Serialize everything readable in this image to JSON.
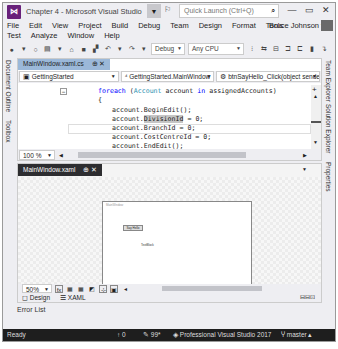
{
  "window": {
    "title": "Chapter 4 - Microsoft Visual Studio",
    "quick_launch_placeholder": "Quick Launch (Ctrl+Q)",
    "user": "Bruce Johnson",
    "user_arrow": "▾"
  },
  "menu": {
    "row1": [
      "File",
      "Edit",
      "View",
      "Project",
      "Build",
      "Debug",
      "Team",
      "Design",
      "Format",
      "Tools"
    ],
    "row2": [
      "Test",
      "Analyze",
      "Window",
      "Help"
    ]
  },
  "toolbar": {
    "config": "Debug",
    "platform": "Any CPU"
  },
  "left_tabs": [
    "Document Outline",
    "Toolbox"
  ],
  "right_tabs": [
    "Team Explorer",
    "Solution Explorer",
    "Properties"
  ],
  "editor": {
    "tab_label": "MainWindow.xaml.cs",
    "tab_pin": "⊕",
    "tab_close": "✕",
    "nav": {
      "project": "GettingStarted",
      "class": "GettingStarted.MainWindow",
      "member": "btnSayHello_Click(object sender"
    },
    "code": {
      "line1_kw": "foreach",
      "line1_a": " (",
      "line1_type": "Account",
      "line1_b": " account ",
      "line1_in": "in",
      "line1_c": " assignedAccounts)",
      "line2": "{",
      "line3": "account.BeginEdit();",
      "line4_a": "account.",
      "line4_sel": "DivisionId",
      "line4_b": " = 0;",
      "line5": "account.BranchId = 0;",
      "line6": "account.CostCentreId = 0;",
      "line7": "account.EndEdit();"
    },
    "zoom": "100 %"
  },
  "designer": {
    "tab_label": "MainWindow.xaml",
    "tab_pin": "⊕",
    "tab_close": "✕",
    "form_title": "MainWindow",
    "button_label": "Say Hello",
    "textblock_label": "TextBlock",
    "zoom": "50%",
    "view_tabs": [
      "Design",
      "XAML"
    ]
  },
  "panels": {
    "error_list": "Error List"
  },
  "status": {
    "ready": "Ready",
    "up_count": "0",
    "edits": "99*",
    "repo": "Professional Visual Studio 2017",
    "branch": "master"
  }
}
